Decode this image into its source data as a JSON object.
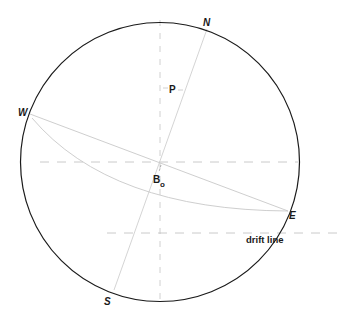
{
  "diagram": {
    "type": "stereographic projection / celestial sphere",
    "labels": {
      "north": "N",
      "south": "S",
      "west": "W",
      "east": "E",
      "pole": "P",
      "point_b": "B",
      "point_b_sub": "o",
      "drift_line": "drift line"
    },
    "colors": {
      "circle": "#1a1a1a",
      "faint_line": "#c8c8c8",
      "dashed_line": "#bdbdbd",
      "text": "#1a1a1a",
      "background": "#ffffff"
    }
  }
}
